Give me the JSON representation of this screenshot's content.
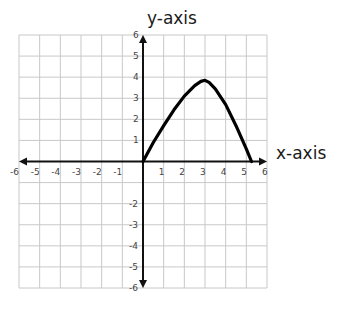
{
  "chart_data": {
    "type": "line",
    "title": "",
    "xlabel": "x-axis",
    "ylabel": "y-axis",
    "xlim": [
      -6,
      6
    ],
    "ylim": [
      -6,
      6
    ],
    "grid": true,
    "x_ticks": [
      "-6",
      "-5",
      "-4",
      "-3",
      "-2",
      "-1",
      "1",
      "2",
      "3",
      "4",
      "5",
      "6"
    ],
    "y_ticks": [
      "6",
      "5",
      "4",
      "3",
      "2",
      "1",
      "-2",
      "-3",
      "-4",
      "-5",
      "-6"
    ],
    "series": [
      {
        "name": "curve",
        "x": [
          0,
          0.5,
          1,
          1.5,
          2,
          2.5,
          2.8,
          3,
          3.2,
          3.5,
          4,
          4.5,
          5,
          5.25
        ],
        "y": [
          0,
          0.9,
          1.7,
          2.45,
          3.1,
          3.6,
          3.8,
          3.85,
          3.75,
          3.45,
          2.7,
          1.7,
          0.6,
          0
        ],
        "color": "#000000"
      }
    ]
  },
  "colors": {
    "grid": "#c8c8c8",
    "axis": "#111111",
    "curve": "#000000",
    "tick_label": "#444444"
  }
}
